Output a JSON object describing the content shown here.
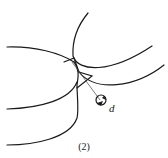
{
  "figure": {
    "caption": "(2)",
    "label_d": "d",
    "stroke_color": "#1a1a1a"
  }
}
